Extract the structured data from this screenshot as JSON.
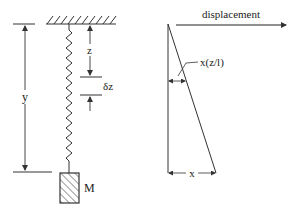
{
  "figure": {
    "left_panel": {
      "title": "spring-mass system",
      "labels": {
        "y": "y",
        "z": "z",
        "dz": "δz",
        "mass": "M"
      }
    },
    "right_panel": {
      "title": "displacement profile",
      "labels": {
        "axis": "displacement",
        "local_displacement": "x(z/l)",
        "total_displacement": "x"
      }
    },
    "colors": {
      "stroke": "#333333",
      "background": "#ffffff"
    }
  }
}
